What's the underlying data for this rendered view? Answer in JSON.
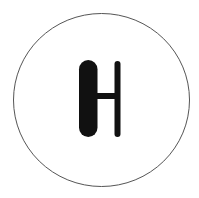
{
  "symbol": {
    "name": "H",
    "description": "Stylized letter H inside a circle",
    "colors": {
      "background": "#ffffff",
      "outline": "#555555",
      "glyph": "#111111"
    }
  }
}
